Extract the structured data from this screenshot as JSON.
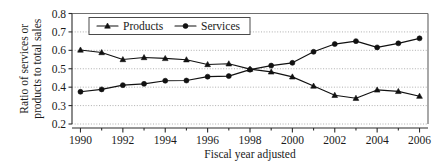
{
  "chart_data": {
    "type": "line",
    "title": "",
    "xlabel": "Fiscal year adjusted",
    "ylabel": "Ratio of services or products to total sales",
    "ylabel_line1": "Ratio of services or",
    "ylabel_line2": "products to total sales",
    "x": [
      1990,
      1991,
      1992,
      1993,
      1994,
      1995,
      1996,
      1997,
      1998,
      1999,
      2000,
      2001,
      2002,
      2003,
      2004,
      2005,
      2006
    ],
    "xtick_labels": [
      "1990",
      "1992",
      "1994",
      "1996",
      "1998",
      "2000",
      "2002",
      "2004",
      "2006"
    ],
    "xtick_values": [
      1990,
      1992,
      1994,
      1996,
      1998,
      2000,
      2002,
      2004,
      2006
    ],
    "xminor_values": [
      1991,
      1993,
      1995,
      1997,
      1999,
      2001,
      2003,
      2005
    ],
    "ytick_labels": [
      "0.2",
      "0.3",
      "0.4",
      "0.5",
      "0.6",
      "0.7",
      "0.8"
    ],
    "ytick_values": [
      0.2,
      0.3,
      0.4,
      0.5,
      0.6,
      0.7,
      0.8
    ],
    "xlim": [
      1989.6,
      2006.4
    ],
    "ylim": [
      0.2,
      0.8
    ],
    "grid": true,
    "grid_style": "dotted-horizontal",
    "legend_position": "top-center",
    "series": [
      {
        "name": "Products",
        "marker": "triangle",
        "color": "#111111",
        "values": [
          0.602,
          0.588,
          0.55,
          0.561,
          0.556,
          0.549,
          0.523,
          0.527,
          0.498,
          0.483,
          0.456,
          0.406,
          0.356,
          0.34,
          0.385,
          0.377,
          0.351
        ]
      },
      {
        "name": "Services",
        "marker": "circle",
        "color": "#111111",
        "values": [
          0.375,
          0.388,
          0.411,
          0.418,
          0.435,
          0.436,
          0.457,
          0.46,
          0.495,
          0.517,
          0.532,
          0.592,
          0.634,
          0.65,
          0.616,
          0.638,
          0.665
        ]
      }
    ]
  }
}
